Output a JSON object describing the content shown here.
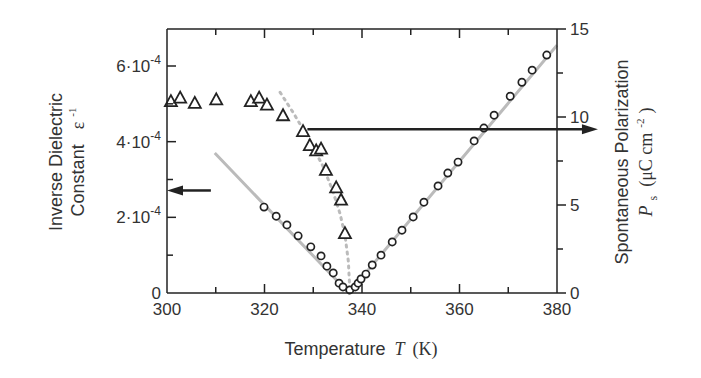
{
  "chart_data": {
    "type": "scatter",
    "title": "",
    "xlabel": "Temperature",
    "xlabel_symbol": "T",
    "xlabel_unit": "(K)",
    "xlim": [
      300,
      380
    ],
    "x_ticks": [
      300,
      320,
      340,
      360,
      380
    ],
    "x_tick_labels": [
      "300",
      "320",
      "340",
      "360",
      "380"
    ],
    "ylabel_left_line1": "Inverse Dielectric",
    "ylabel_left_line2": "Constant",
    "ylabel_left_symbol": "ε",
    "ylabel_left_exp": "-1",
    "ylim_left": [
      0,
      0.0006
    ],
    "y_left_ticks": [
      0,
      0.0002,
      0.0004,
      0.0006
    ],
    "y_left_tick_labels": [
      {
        "mant": "0",
        "exp": ""
      },
      {
        "mant": "2·10",
        "exp": "-4"
      },
      {
        "mant": "4·10",
        "exp": "-4"
      },
      {
        "mant": "6·10",
        "exp": "-4"
      }
    ],
    "ylabel_right_line1": "Spontaneous Polarization",
    "ylabel_right_symbol": "P",
    "ylabel_right_sub": "s",
    "ylabel_right_unit_open": "(μC cm",
    "ylabel_right_unit_exp": "-2",
    "ylabel_right_unit_close": ")",
    "ylim_right": [
      0,
      15
    ],
    "y_right_ticks": [
      0,
      5,
      10,
      15
    ],
    "y_right_tick_labels": [
      "0",
      "5",
      "10",
      "15"
    ],
    "grid": false,
    "series": [
      {
        "name": "Inverse dielectric constant",
        "axis": "left",
        "marker": "circle",
        "x": [
          319.9,
          322.4,
          324.6,
          326.9,
          329.5,
          331.6,
          332.8,
          334.1,
          335.3,
          336.1,
          337.5,
          338.6,
          339.2,
          339.8,
          340.8,
          342.1,
          343.9,
          346.2,
          348.2,
          350.5,
          352.7,
          355.6,
          357.6,
          359.7,
          363.0,
          365.0,
          367.1,
          370.4,
          372.8,
          374.9,
          377.9
        ],
        "y": [
          0.000227,
          0.000203,
          0.00018,
          0.000151,
          0.000122,
          9.8e-05,
          7.1e-05,
          5.3e-05,
          2.6e-05,
          1.6e-05,
          8e-06,
          1.6e-05,
          2.6e-05,
          3.7e-05,
          5e-05,
          7.4e-05,
          0.0001,
          0.000135,
          0.000166,
          0.000201,
          0.00024,
          0.000283,
          0.000317,
          0.000346,
          0.000402,
          0.000436,
          0.00047,
          0.00052,
          0.000557,
          0.000589,
          0.000629
        ]
      },
      {
        "name": "Spontaneous polarization",
        "axis": "right",
        "marker": "triangle",
        "x": [
          300.8,
          302.7,
          305.7,
          310.1,
          317.2,
          318.9,
          320.5,
          323.8,
          327.9,
          329.3,
          330.6,
          331.6,
          332.6,
          334.7,
          335.7,
          336.5
        ],
        "y": [
          10.9,
          11.1,
          10.8,
          11.0,
          10.9,
          11.1,
          10.7,
          10.1,
          9.2,
          8.4,
          8.1,
          8.2,
          7.0,
          6.0,
          5.3,
          3.4
        ]
      },
      {
        "name": "Curie-Weiss fit",
        "axis": "left",
        "style": "solid-gray",
        "x": [
          309.8,
          337.3,
          380.0
        ],
        "y": [
          0.00037,
          0.0,
          0.000655
        ]
      },
      {
        "name": "Polarization fit",
        "axis": "right",
        "style": "dotted-gray",
        "x": [
          323.2,
          326,
          329,
          332,
          334,
          335.5,
          336.5,
          337.2,
          337.5
        ],
        "y": [
          11.4,
          10.2,
          8.8,
          7.2,
          5.8,
          4.5,
          3.3,
          1.8,
          0.2
        ]
      }
    ],
    "annotations": [
      {
        "type": "arrow",
        "direction": "left",
        "refers_to": "left axis",
        "x": [
          309,
          300
        ],
        "y_left": 0.000271
      },
      {
        "type": "arrow",
        "direction": "right",
        "refers_to": "right axis",
        "x": [
          328.8,
          388.4
        ],
        "y_right": 9.3
      }
    ],
    "colors": {
      "axis": "#222222",
      "marker": "#222222",
      "fit": "#bbbbbb",
      "text": "#333333"
    }
  }
}
